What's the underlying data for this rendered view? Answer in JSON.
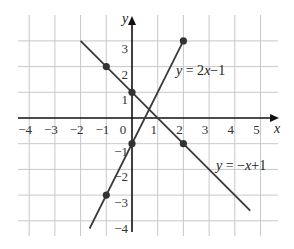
{
  "chart_data": {
    "type": "line",
    "title": "",
    "xlabel": "x",
    "ylabel": "y",
    "xlim": [
      -4,
      5
    ],
    "ylim": [
      -4,
      3
    ],
    "grid": true,
    "x_ticks": [
      "-4",
      "-3",
      "-2",
      "-1",
      "0",
      "1",
      "2",
      "3",
      "4",
      "5"
    ],
    "y_ticks": [
      "3",
      "2",
      "1",
      "-1",
      "-2",
      "-3",
      "-4"
    ],
    "series": [
      {
        "name": "y = 2x−1",
        "label": "y = 2x−1",
        "segment": {
          "x1": -1.65,
          "y1": -4.3,
          "x2": 2,
          "y2": 3
        },
        "points": [
          {
            "x": -1,
            "y": -3
          },
          {
            "x": 0,
            "y": -1
          },
          {
            "x": 2,
            "y": 3
          }
        ]
      },
      {
        "name": "y = −x+1",
        "label": "y = −x+1",
        "segment": {
          "x1": -2,
          "y1": 3,
          "x2": 4.6,
          "y2": -3.6
        },
        "points": [
          {
            "x": -1,
            "y": 2
          },
          {
            "x": 0,
            "y": 1
          },
          {
            "x": 2,
            "y": -1
          }
        ]
      }
    ],
    "colors": {
      "grid": "#c8c8c8",
      "axis": "#111111",
      "line": "#3a3a3a",
      "point": "#333333"
    }
  }
}
